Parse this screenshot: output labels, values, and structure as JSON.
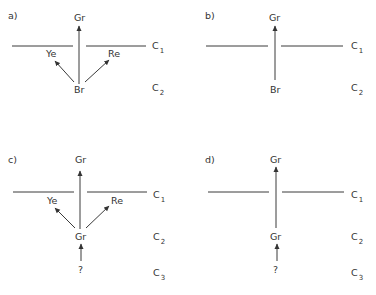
{
  "panels": [
    {
      "id": "a",
      "label": "a)",
      "top_node": "Gr",
      "source_node": "Br",
      "left_node": "Ye",
      "right_node": "Re",
      "layer_labels": [
        {
          "base": "C",
          "sub": "1"
        },
        {
          "base": "C",
          "sub": "2"
        }
      ]
    },
    {
      "id": "b",
      "label": "b)",
      "top_node": "Gr",
      "source_node": "Br",
      "layer_labels": [
        {
          "base": "C",
          "sub": "1"
        },
        {
          "base": "C",
          "sub": "2"
        }
      ]
    },
    {
      "id": "c",
      "label": "c)",
      "top_node": "Gr",
      "source_node": "Gr",
      "left_node": "Ye",
      "right_node": "Re",
      "origin_node": "?",
      "layer_labels": [
        {
          "base": "C",
          "sub": "1"
        },
        {
          "base": "C",
          "sub": "2"
        },
        {
          "base": "C",
          "sub": "3"
        }
      ]
    },
    {
      "id": "d",
      "label": "d)",
      "top_node": "Gr",
      "source_node": "Gr",
      "origin_node": "?",
      "layer_labels": [
        {
          "base": "C",
          "sub": "1"
        },
        {
          "base": "C",
          "sub": "2"
        },
        {
          "base": "C",
          "sub": "3"
        }
      ]
    }
  ]
}
